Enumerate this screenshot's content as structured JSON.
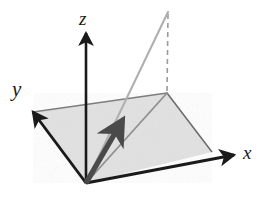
{
  "figure": {
    "kind": "3d-coordinate-diagram",
    "title": "",
    "background_color": "#ffffff"
  },
  "axes": {
    "x": {
      "label": "x",
      "label_position": {
        "x": 243,
        "y": 159
      },
      "start": {
        "x": 86,
        "y": 183
      },
      "end": {
        "x": 234,
        "y": 155
      },
      "color": "#1a1a1a",
      "arrow": true
    },
    "y": {
      "label": "y",
      "label_position": {
        "x": 12,
        "y": 96
      },
      "start": {
        "x": 86,
        "y": 183
      },
      "end": {
        "x": 33,
        "y": 112
      },
      "color": "#1a1a1a",
      "arrow": true
    },
    "z": {
      "label": "z",
      "label_position": {
        "x": 79,
        "y": 25
      },
      "start": {
        "x": 86,
        "y": 183
      },
      "end": {
        "x": 86,
        "y": 33
      },
      "color": "#1a1a1a",
      "arrow": true
    }
  },
  "plane": {
    "name": "shaded-ground-plane",
    "fill_color": "#e2e2e2",
    "edge_color": "#6f6f6f",
    "corners": [
      {
        "name": "origin",
        "x": 86,
        "y": 183
      },
      {
        "name": "left",
        "x": 33,
        "y": 112
      },
      {
        "name": "far",
        "x": 167,
        "y": 93
      },
      {
        "name": "right",
        "x": 212,
        "y": 152
      }
    ]
  },
  "vectors": {
    "primary": {
      "name": "bold-vector-arrow",
      "color": "#4a4a4a",
      "start": {
        "x": 86,
        "y": 183
      },
      "end": {
        "x": 122,
        "y": 121
      },
      "arrow": true
    },
    "lifted_ray": {
      "name": "gray-ray-to-apex",
      "color": "#b0b0b0",
      "start": {
        "x": 86,
        "y": 183
      },
      "end": {
        "x": 168,
        "y": 12
      },
      "arrow": false
    },
    "ground_diagonal": {
      "name": "gray-diagonal-to-far-corner",
      "color": "#909090",
      "start": {
        "x": 86,
        "y": 183
      },
      "end": {
        "x": 167,
        "y": 93
      },
      "arrow": false
    }
  },
  "projection_line": {
    "name": "dashed-vertical-projection",
    "color": "#9a9a9a",
    "style": "dashed",
    "dash_pattern": "5 4",
    "start": {
      "x": 168,
      "y": 14
    },
    "end": {
      "x": 167,
      "y": 93
    }
  }
}
